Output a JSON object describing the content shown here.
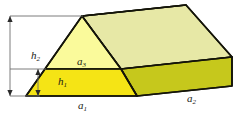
{
  "figure": {
    "type": "geometry-diagram",
    "shape": "triangular prism (wedge) drawn in oblique projection",
    "labels": {
      "h2": {
        "text": "h",
        "sub": "2",
        "meaning": "full height of triangular face"
      },
      "h1": {
        "text": "h",
        "sub": "1",
        "meaning": "height of lower trapezoid band"
      },
      "a3": {
        "text": "a",
        "sub": "3",
        "meaning": "upper triangle region label"
      },
      "a1": {
        "text": "a",
        "sub": "1",
        "meaning": "front base edge length"
      },
      "a2": {
        "text": "a",
        "sub": "2",
        "meaning": "depth / side edge length"
      }
    },
    "colors": {
      "front_lower_trapezoid": "#F5E415",
      "front_upper_triangle": "#FAFA9B",
      "top_roof_panel": "#E7E8A6",
      "side_lower_panel": "#C6C81C",
      "outline": "#141409",
      "dimension_line": "#6d6d6d"
    },
    "geometry": {
      "front_apex": [
        82,
        16
      ],
      "front_bottom_left": [
        26,
        96
      ],
      "front_bottom_right": [
        137,
        96
      ],
      "back_apex": [
        186,
        5
      ],
      "back_bottom_right": [
        232,
        86
      ],
      "front_divider_left": [
        45,
        69
      ],
      "front_divider_right": [
        121,
        69
      ],
      "side_divider_right": [
        232,
        57
      ]
    },
    "dimensions": {
      "h2_line_x": 10,
      "h2_top_y": 16,
      "h2_bottom_y": 96,
      "h1_line_x": 38,
      "h1_top_y": 69,
      "h1_bottom_y": 96
    }
  }
}
